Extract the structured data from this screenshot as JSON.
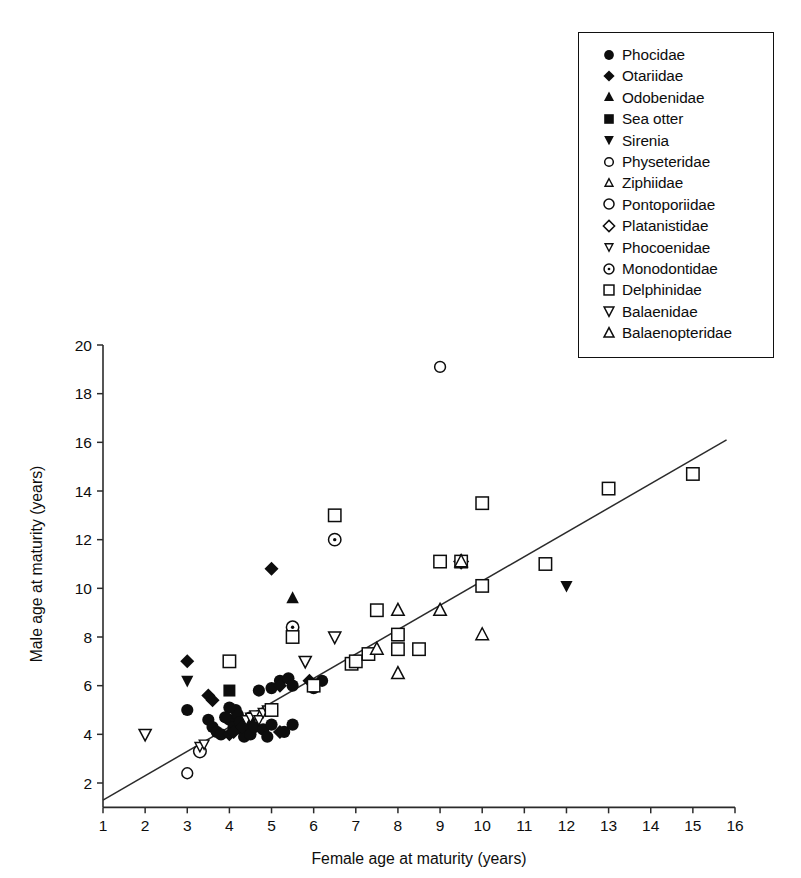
{
  "chart_data": {
    "type": "scatter",
    "title": "",
    "xlabel": "Female age at maturity (years)",
    "ylabel": "Male age at maturity (years)",
    "xlim": [
      1,
      16
    ],
    "ylim": [
      1,
      20
    ],
    "xticks": [
      1,
      2,
      3,
      4,
      5,
      6,
      7,
      8,
      9,
      10,
      11,
      12,
      13,
      14,
      15,
      16
    ],
    "yticks": [
      2,
      4,
      6,
      8,
      10,
      12,
      14,
      16,
      18,
      20
    ],
    "xtick_labels": [
      "1",
      "2",
      "3",
      "4",
      "5",
      "6",
      "7",
      "8",
      "9",
      "10",
      "11",
      "12",
      "13",
      "14",
      "15",
      "16"
    ],
    "ytick_labels": [
      "2",
      "4",
      "6",
      "8",
      "10",
      "12",
      "14",
      "16",
      "18",
      "20"
    ],
    "grid": false,
    "legend_position": "top-right",
    "trendline": {
      "x0": 1.0,
      "y0": 1.3,
      "x1": 15.8,
      "y1": 16.1,
      "style": "solid"
    },
    "series": [
      {
        "name": "Phocidae",
        "marker": "filled-circle",
        "points": [
          [
            3.0,
            5.0
          ],
          [
            3.5,
            4.6
          ],
          [
            3.6,
            4.3
          ],
          [
            3.7,
            4.1
          ],
          [
            3.8,
            4.0
          ],
          [
            4.0,
            4.6
          ],
          [
            4.1,
            4.3
          ],
          [
            4.15,
            5.0
          ],
          [
            4.2,
            4.8
          ],
          [
            4.25,
            4.5
          ],
          [
            4.3,
            4.2
          ],
          [
            4.35,
            3.9
          ],
          [
            4.4,
            4.4
          ],
          [
            4.5,
            4.7
          ],
          [
            4.5,
            4.0
          ],
          [
            4.6,
            4.3
          ],
          [
            4.7,
            5.8
          ],
          [
            4.8,
            4.2
          ],
          [
            4.9,
            3.9
          ],
          [
            5.0,
            5.9
          ],
          [
            5.0,
            4.4
          ],
          [
            5.2,
            6.2
          ],
          [
            5.3,
            4.1
          ],
          [
            5.4,
            6.3
          ],
          [
            5.5,
            4.4
          ],
          [
            5.5,
            6.0
          ],
          [
            6.0,
            5.9
          ],
          [
            6.2,
            6.2
          ],
          [
            4.0,
            5.1
          ],
          [
            3.9,
            4.7
          ]
        ]
      },
      {
        "name": "Otariidae",
        "marker": "filled-diamond",
        "points": [
          [
            3.0,
            7.0
          ],
          [
            3.5,
            5.6
          ],
          [
            3.6,
            5.4
          ],
          [
            4.0,
            4.0
          ],
          [
            4.1,
            4.1
          ],
          [
            4.3,
            4.3
          ],
          [
            5.0,
            10.8
          ],
          [
            5.2,
            4.1
          ],
          [
            5.9,
            6.2
          ],
          [
            5.2,
            6.0
          ]
        ]
      },
      {
        "name": "Odobenidae",
        "marker": "filled-triangle-up",
        "points": [
          [
            5.5,
            9.6
          ]
        ]
      },
      {
        "name": "Sea otter",
        "marker": "filled-square",
        "points": [
          [
            4.0,
            5.8
          ]
        ]
      },
      {
        "name": "Sirenia",
        "marker": "filled-triangle-down",
        "points": [
          [
            3.0,
            6.2
          ],
          [
            12.0,
            10.1
          ]
        ]
      },
      {
        "name": "Physeteridae",
        "marker": "open-circle-small",
        "points": [
          [
            3.0,
            2.4
          ],
          [
            9.0,
            19.1
          ]
        ]
      },
      {
        "name": "Ziphiidae",
        "marker": "open-triangle-up-small",
        "points": [
          [
            7.0,
            7.0
          ]
        ]
      },
      {
        "name": "Pontoporiidae",
        "marker": "open-circle",
        "points": [
          [
            3.3,
            3.3
          ]
        ]
      },
      {
        "name": "Platanistidae",
        "marker": "open-diamond",
        "points": [
          [
            9.5,
            11.1
          ]
        ]
      },
      {
        "name": "Phocoenidae",
        "marker": "open-triangle-down-small",
        "points": [
          [
            3.3,
            3.5
          ],
          [
            3.4,
            3.6
          ],
          [
            4.4,
            4.6
          ],
          [
            4.5,
            4.7
          ],
          [
            4.6,
            4.8
          ],
          [
            4.7,
            4.6
          ],
          [
            4.8,
            4.9
          ],
          [
            4.9,
            5.0
          ],
          [
            5.0,
            5.1
          ],
          [
            6.0,
            6.1
          ]
        ]
      },
      {
        "name": "Monodontidae",
        "marker": "dotted-circle",
        "points": [
          [
            5.5,
            8.4
          ],
          [
            6.5,
            12.0
          ]
        ]
      },
      {
        "name": "Delphinidae",
        "marker": "open-square",
        "points": [
          [
            4.0,
            7.0
          ],
          [
            5.0,
            5.0
          ],
          [
            5.5,
            8.0
          ],
          [
            6.0,
            6.0
          ],
          [
            6.5,
            13.0
          ],
          [
            6.9,
            6.9
          ],
          [
            7.0,
            7.0
          ],
          [
            7.5,
            9.1
          ],
          [
            8.0,
            8.1
          ],
          [
            8.0,
            7.5
          ],
          [
            8.5,
            7.5
          ],
          [
            9.0,
            11.1
          ],
          [
            9.5,
            11.1
          ],
          [
            10.0,
            13.5
          ],
          [
            10.0,
            10.1
          ],
          [
            11.5,
            11.0
          ],
          [
            13.0,
            14.1
          ],
          [
            15.0,
            14.7
          ],
          [
            7.3,
            7.3
          ]
        ]
      },
      {
        "name": "Balaenidae",
        "marker": "open-triangle-down",
        "points": [
          [
            2.0,
            4.0
          ],
          [
            5.8,
            7.0
          ],
          [
            6.5,
            8.0
          ]
        ]
      },
      {
        "name": "Balaenopteridae",
        "marker": "open-triangle-up",
        "points": [
          [
            7.5,
            7.5
          ],
          [
            8.0,
            9.1
          ],
          [
            8.0,
            6.5
          ],
          [
            9.0,
            9.1
          ],
          [
            9.5,
            11.1
          ],
          [
            10.0,
            8.1
          ]
        ]
      }
    ]
  },
  "legend": {
    "items": [
      {
        "label": "Phocidae",
        "marker": "filled-circle"
      },
      {
        "label": "Otariidae",
        "marker": "filled-diamond"
      },
      {
        "label": "Odobenidae",
        "marker": "filled-triangle-up"
      },
      {
        "label": "Sea otter",
        "marker": "filled-square"
      },
      {
        "label": "Sirenia",
        "marker": "filled-triangle-down"
      },
      {
        "label": "Physeteridae",
        "marker": "open-circle-small"
      },
      {
        "label": "Ziphiidae",
        "marker": "open-triangle-up-small"
      },
      {
        "label": "Pontoporiidae",
        "marker": "open-circle"
      },
      {
        "label": "Platanistidae",
        "marker": "open-diamond"
      },
      {
        "label": "Phocoenidae",
        "marker": "open-triangle-down-small"
      },
      {
        "label": "Monodontidae",
        "marker": "dotted-circle"
      },
      {
        "label": "Delphinidae",
        "marker": "open-square"
      },
      {
        "label": "Balaenidae",
        "marker": "open-triangle-down"
      },
      {
        "label": "Balaenopteridae",
        "marker": "open-triangle-up"
      }
    ]
  },
  "colors": {
    "ink": "#0d0d0d",
    "line": "#2b2b2b",
    "background": "#ffffff"
  }
}
